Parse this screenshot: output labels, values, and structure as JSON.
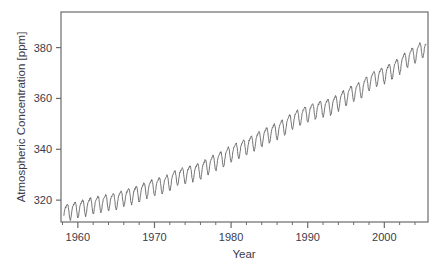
{
  "figure": {
    "background_color": "#ffffff",
    "line_color": "#5c5c5c",
    "frame_color": "#6b6b6b",
    "text_color": "#3b3b4a",
    "caption_partial": "                                                                                     "
  },
  "chart_data": {
    "type": "line",
    "title": "",
    "xlabel": "Year",
    "ylabel": "Atmospheric Concentration [ppm]",
    "xlim": [
      1957.8,
      2005.7
    ],
    "ylim": [
      311.4,
      394.0
    ],
    "grid": false,
    "legend": null,
    "x_major_ticks": [
      1960,
      1970,
      1980,
      1990,
      2000
    ],
    "x_major_tick_labels": [
      "1960",
      "1970",
      "1980",
      "1990",
      "2000"
    ],
    "x_minor_tick_step": 2,
    "y_major_ticks": [
      320,
      340,
      360,
      380
    ],
    "y_major_tick_labels": [
      "320",
      "340",
      "360",
      "380"
    ],
    "series": [
      {
        "name": "Mauna Loa CO2 monthly mean",
        "description": "Keeling Curve: monthly mean atmospheric CO2 concentration with annual seasonal oscillation superimposed on a rising trend",
        "seasonal_amplitude_ppm": 6.0,
        "annual_means": [
          {
            "year": 1958,
            "value": 315.3
          },
          {
            "year": 1959,
            "value": 315.98
          },
          {
            "year": 1960,
            "value": 316.91
          },
          {
            "year": 1961,
            "value": 317.64
          },
          {
            "year": 1962,
            "value": 318.45
          },
          {
            "year": 1963,
            "value": 318.99
          },
          {
            "year": 1964,
            "value": 319.62
          },
          {
            "year": 1965,
            "value": 320.04
          },
          {
            "year": 1966,
            "value": 321.37
          },
          {
            "year": 1967,
            "value": 322.18
          },
          {
            "year": 1968,
            "value": 323.05
          },
          {
            "year": 1969,
            "value": 324.62
          },
          {
            "year": 1970,
            "value": 325.68
          },
          {
            "year": 1971,
            "value": 326.32
          },
          {
            "year": 1972,
            "value": 327.46
          },
          {
            "year": 1973,
            "value": 329.68
          },
          {
            "year": 1974,
            "value": 330.19
          },
          {
            "year": 1975,
            "value": 331.12
          },
          {
            "year": 1976,
            "value": 332.03
          },
          {
            "year": 1977,
            "value": 333.84
          },
          {
            "year": 1978,
            "value": 335.41
          },
          {
            "year": 1979,
            "value": 336.84
          },
          {
            "year": 1980,
            "value": 338.76
          },
          {
            "year": 1981,
            "value": 340.12
          },
          {
            "year": 1982,
            "value": 341.48
          },
          {
            "year": 1983,
            "value": 343.15
          },
          {
            "year": 1984,
            "value": 344.85
          },
          {
            "year": 1985,
            "value": 346.35
          },
          {
            "year": 1986,
            "value": 347.61
          },
          {
            "year": 1987,
            "value": 349.31
          },
          {
            "year": 1988,
            "value": 351.69
          },
          {
            "year": 1989,
            "value": 353.2
          },
          {
            "year": 1990,
            "value": 354.45
          },
          {
            "year": 1991,
            "value": 355.7
          },
          {
            "year": 1992,
            "value": 356.54
          },
          {
            "year": 1993,
            "value": 357.21
          },
          {
            "year": 1994,
            "value": 358.96
          },
          {
            "year": 1995,
            "value": 360.97
          },
          {
            "year": 1996,
            "value": 362.74
          },
          {
            "year": 1997,
            "value": 363.88
          },
          {
            "year": 1998,
            "value": 366.84
          },
          {
            "year": 1999,
            "value": 368.54
          },
          {
            "year": 2000,
            "value": 369.71
          },
          {
            "year": 2001,
            "value": 371.32
          },
          {
            "year": 2002,
            "value": 373.45
          },
          {
            "year": 2003,
            "value": 375.98
          },
          {
            "year": 2004,
            "value": 377.7
          },
          {
            "year": 2005,
            "value": 379.8
          }
        ],
        "start_value_ppm": 315.3,
        "end_value_ppm": 379.8,
        "peak_value_ppm": 381.5,
        "min_value_ppm": 312.8
      }
    ]
  }
}
